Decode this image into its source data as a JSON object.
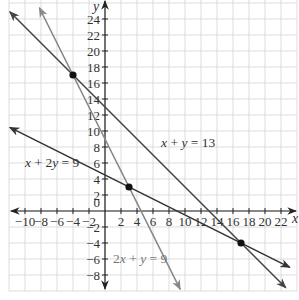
{
  "chart_data": {
    "type": "line",
    "title": "",
    "xlabel": "x",
    "ylabel": "y",
    "xlim": [
      -12,
      24
    ],
    "ylim": [
      -10,
      26
    ],
    "grid": true,
    "grid_step": 2,
    "x_ticks": [
      -10,
      -8,
      -6,
      -4,
      -2,
      2,
      4,
      6,
      8,
      10,
      12,
      14,
      16,
      18,
      20,
      22
    ],
    "x_tick_labels": [
      "−10",
      "−8",
      "−6",
      "−4",
      "−2",
      "2",
      "4",
      "6",
      "8",
      "10",
      "12",
      "14",
      "16",
      "18",
      "20",
      "22"
    ],
    "y_ticks": [
      -8,
      -6,
      -4,
      -2,
      2,
      4,
      6,
      8,
      10,
      12,
      14,
      16,
      18,
      20,
      22,
      24
    ],
    "y_tick_labels": [
      "−8",
      "−6",
      "−4",
      "−2",
      "2",
      "4",
      "6",
      "8",
      "10",
      "12",
      "14",
      "16",
      "18",
      "20",
      "22",
      "24"
    ],
    "origin_label": "0",
    "series": [
      {
        "name": "x + y = 13",
        "label": "x + y = 13",
        "color": "#444444",
        "x": [
          -11.9,
          22.6
        ],
        "y": [
          24.9,
          -9.6
        ],
        "label_pos": [
          7,
          8
        ]
      },
      {
        "name": "2x + y = 9",
        "label": "2x + y = 9",
        "color": "#888888",
        "x": [
          -8.2,
          9.4
        ],
        "y": [
          25.4,
          -9.8
        ],
        "label_pos": [
          1,
          -6.5
        ]
      },
      {
        "name": "x + 2y = 9",
        "label": "x + 2y = 9",
        "color": "#333333",
        "x": [
          -11.9,
          23.1
        ],
        "y": [
          10.45,
          -7.05
        ],
        "label_pos": [
          -10,
          5.5
        ]
      }
    ],
    "points": [
      {
        "x": -4,
        "y": 17,
        "label": "intersection of x + y = 13 and 2x + y = 9"
      },
      {
        "x": 3,
        "y": 3,
        "label": "intersection of 2x + y = 9 and x + 2y = 9"
      },
      {
        "x": 17,
        "y": -4,
        "label": "intersection of x + y = 13 and x + 2y = 9"
      }
    ],
    "legend": "none (inline line labels)"
  }
}
